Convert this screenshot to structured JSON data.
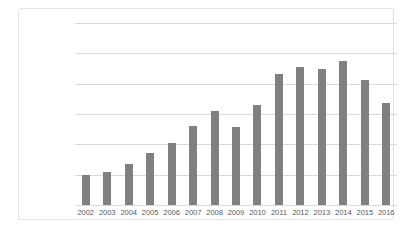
{
  "chart_data": {
    "type": "bar",
    "title": "",
    "xlabel": "",
    "ylabel": "",
    "categories": [
      "2002",
      "2003",
      "2004",
      "2005",
      "2006",
      "2007",
      "2008",
      "2009",
      "2010",
      "2011",
      "2012",
      "2013",
      "2014",
      "2015",
      "2016"
    ],
    "values": [
      9800000,
      11000000,
      13400000,
      17200000,
      20600000,
      26100000,
      30900000,
      25800000,
      33000000,
      43300000,
      45400000,
      45000000,
      47400000,
      41200000,
      33700000
    ],
    "series": [
      {
        "name": "Series 1",
        "color": "#808080",
        "values": [
          9800000,
          11000000,
          13400000,
          17200000,
          20600000,
          26100000,
          30900000,
          25800000,
          33000000,
          43300000,
          45400000,
          45000000,
          47400000,
          41200000,
          33700000
        ]
      }
    ],
    "ylim": [
      0,
      60000000
    ],
    "ytick_labels": [
      "0",
      "10000000",
      "20000000",
      "30000000",
      "40000000",
      "50000000",
      "60000000"
    ],
    "ytick_values": [
      0,
      10000000,
      20000000,
      30000000,
      40000000,
      50000000,
      60000000
    ],
    "grid": true,
    "legend": false,
    "legend_position": "none",
    "bar_color": "#808080",
    "gridline_color": "#d9d9d9",
    "axis_text_color": "#595959",
    "plot_background": "#ffffff",
    "frame_border_color": "#e2e2e2"
  }
}
